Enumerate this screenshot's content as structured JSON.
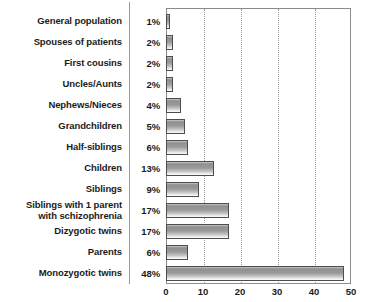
{
  "chart_data": {
    "type": "bar",
    "orientation": "horizontal",
    "title": "",
    "xlabel": "",
    "ylabel": "",
    "xlim": [
      0,
      50
    ],
    "xticks": [
      "0",
      "10",
      "20",
      "30",
      "40",
      "50"
    ],
    "grid": "vertical-dotted",
    "gridline_values": [
      10,
      20,
      30,
      40
    ],
    "legend": "none",
    "value_unit": "%",
    "categories": [
      "General population",
      "Spouses of patients",
      "First cousins",
      "Uncles/Aunts",
      "Nephews/Nieces",
      "Grandchildren",
      "Half-siblings",
      "Children",
      "Siblings",
      "Siblings with 1 parent\nwith schizophrenia",
      "Dizygotic twins",
      "Parents",
      "Monozygotic twins"
    ],
    "values": [
      1,
      2,
      2,
      2,
      4,
      5,
      6,
      13,
      9,
      17,
      17,
      6,
      48
    ],
    "value_labels": [
      "1%",
      "2%",
      "2%",
      "2%",
      "4%",
      "5%",
      "6%",
      "13%",
      "9%",
      "17%",
      "17%",
      "6%",
      "48%"
    ],
    "colors": {
      "bar_gradient_top": "#8f8f8f",
      "bar_gradient_bottom": "#fdfdfd",
      "bar_border": "#4d4d4d",
      "plot_border": "#8c8c8c",
      "gridline": "#9c9c9c",
      "divider": "#9a9a9a",
      "text": "#1b1b1b",
      "background": "#ffffff"
    }
  }
}
